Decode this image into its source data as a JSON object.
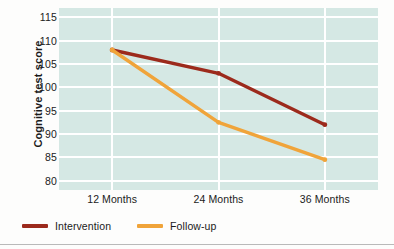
{
  "chart_data": {
    "type": "line",
    "title": "",
    "xlabel": "",
    "ylabel": "Cognitive test score",
    "categories": [
      "12 Months",
      "24 Months",
      "36 Months"
    ],
    "ylim": [
      78,
      117
    ],
    "yticks": [
      80,
      85,
      90,
      95,
      100,
      105,
      110,
      115
    ],
    "grid": true,
    "legend_position": "bottom-left",
    "series": [
      {
        "name": "Intervention",
        "color": "#9c2a1c",
        "values": [
          108,
          103,
          92
        ]
      },
      {
        "name": "Follow-up",
        "color": "#f0a43a",
        "values": [
          108,
          92.5,
          84.5
        ]
      }
    ],
    "colors": {
      "plot_background": "#d5e8e4",
      "gridline": "#ffffff",
      "text": "#1b1b1b",
      "figure_background": "#fdfdfc"
    }
  },
  "axis": {
    "y_title": "Cognitive test score",
    "y_tick_labels": [
      "115",
      "110",
      "105",
      "100",
      "95",
      "90",
      "85",
      "80"
    ],
    "x_tick_labels": [
      "12 Months",
      "24 Months",
      "36 Months"
    ]
  },
  "legend": {
    "entries": [
      {
        "label": "Intervention",
        "swatch": "line-swatch-intervention"
      },
      {
        "label": "Follow-up",
        "swatch": "line-swatch-followup"
      }
    ]
  }
}
